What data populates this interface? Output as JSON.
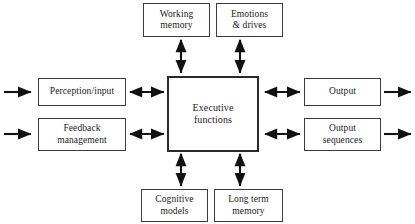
{
  "diagram": {
    "background_color": "#ffffff",
    "line_color": "#111111",
    "box_border_color": "#3a3a3a",
    "center_border_color": "#2a2a2a",
    "text_color": "#1a1a1a",
    "nodes": {
      "working_memory": {
        "label": "Working\nmemory"
      },
      "emotions_drives": {
        "label": "Emotions\n& drives"
      },
      "perception_input": {
        "label": "Perception/input"
      },
      "feedback_management": {
        "label": "Feedback\nmanagement"
      },
      "executive_functions": {
        "label": "Executive\nfunctions"
      },
      "output": {
        "label": "Output"
      },
      "output_sequences": {
        "label": "Output\nsequences"
      },
      "cognitive_models": {
        "label": "Cognitive\nmodels"
      },
      "long_term_memory": {
        "label": "Long term\nmemory"
      }
    },
    "connectors": [
      {
        "name": "external-input-to-perception",
        "type": "single",
        "direction": "right"
      },
      {
        "name": "external-input-to-feedback",
        "type": "single",
        "direction": "right"
      },
      {
        "name": "perception-executive",
        "type": "double",
        "direction": "horizontal"
      },
      {
        "name": "feedback-executive",
        "type": "double",
        "direction": "horizontal"
      },
      {
        "name": "executive-output",
        "type": "double",
        "direction": "horizontal"
      },
      {
        "name": "executive-output-sequences",
        "type": "double",
        "direction": "horizontal"
      },
      {
        "name": "output-to-external",
        "type": "single",
        "direction": "right"
      },
      {
        "name": "output-sequences-to-external",
        "type": "single",
        "direction": "right"
      },
      {
        "name": "working-memory-executive",
        "type": "double",
        "direction": "vertical"
      },
      {
        "name": "emotions-executive",
        "type": "double",
        "direction": "vertical"
      },
      {
        "name": "executive-cognitive-models",
        "type": "double",
        "direction": "vertical"
      },
      {
        "name": "executive-long-term-memory",
        "type": "double",
        "direction": "vertical"
      }
    ]
  }
}
